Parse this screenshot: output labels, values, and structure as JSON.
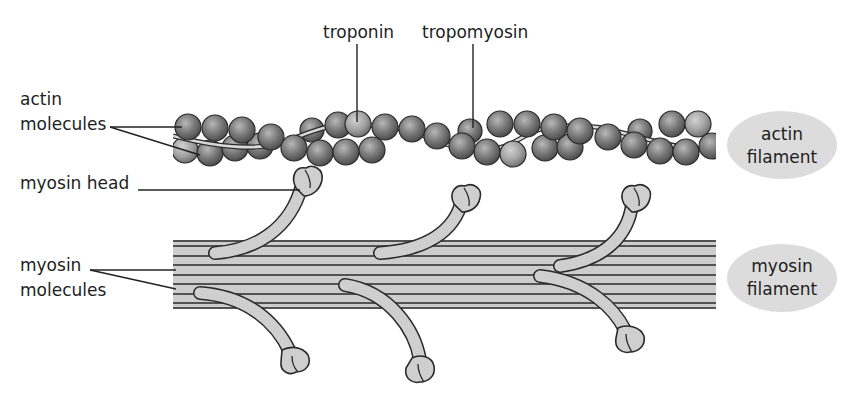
{
  "diagram": {
    "labels": {
      "troponin": "troponin",
      "tropomyosin": "tropomyosin",
      "actin_molecules_line1": "actin",
      "actin_molecules_line2": "molecules",
      "myosin_head": "myosin head",
      "myosin_molecules_line1": "myosin",
      "myosin_molecules_line2": "molecules"
    },
    "legend_ovals": {
      "actin_filament": {
        "line1": "actin",
        "line2": "filament"
      },
      "myosin_filament": {
        "line1": "myosin",
        "line2": "filament"
      }
    },
    "colors": {
      "bead_dark": "#6a6a6a",
      "bead_light": "#a9a9a9",
      "filament_fill": "#cdcdcd",
      "oval_fill": "#dcdcdc",
      "line": "#2a2a2a"
    }
  }
}
